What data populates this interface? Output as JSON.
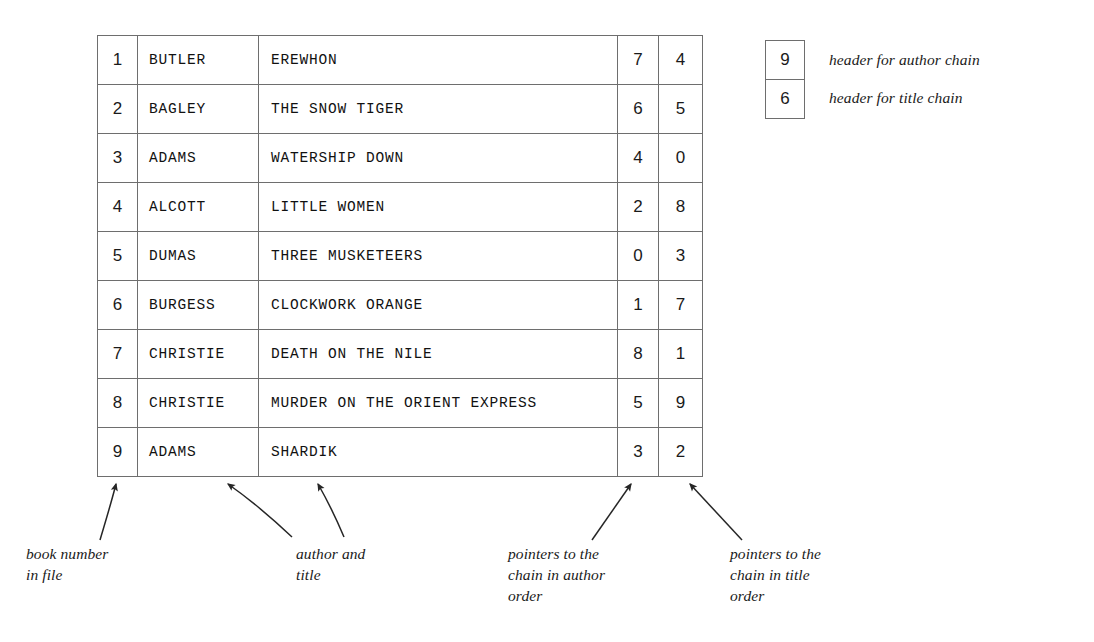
{
  "table": {
    "columns": [
      "book number",
      "author",
      "title",
      "author chain pointer",
      "title chain pointer"
    ],
    "rows": [
      {
        "num": "1",
        "author": "BUTLER",
        "title": "EREWHON",
        "ptr_author": "7",
        "ptr_title": "4"
      },
      {
        "num": "2",
        "author": "BAGLEY",
        "title": "THE SNOW TIGER",
        "ptr_author": "6",
        "ptr_title": "5"
      },
      {
        "num": "3",
        "author": "ADAMS",
        "title": "WATERSHIP DOWN",
        "ptr_author": "4",
        "ptr_title": "0"
      },
      {
        "num": "4",
        "author": "ALCOTT",
        "title": "LITTLE WOMEN",
        "ptr_author": "2",
        "ptr_title": "8"
      },
      {
        "num": "5",
        "author": "DUMAS",
        "title": "THREE MUSKETEERS",
        "ptr_author": "0",
        "ptr_title": "3"
      },
      {
        "num": "6",
        "author": "BURGESS",
        "title": "CLOCKWORK ORANGE",
        "ptr_author": "1",
        "ptr_title": "7"
      },
      {
        "num": "7",
        "author": "CHRISTIE",
        "title": "DEATH ON THE NILE",
        "ptr_author": "8",
        "ptr_title": "1"
      },
      {
        "num": "8",
        "author": "CHRISTIE",
        "title": "MURDER ON THE ORIENT EXPRESS",
        "ptr_author": "5",
        "ptr_title": "9"
      },
      {
        "num": "9",
        "author": "ADAMS",
        "title": "SHARDIK",
        "ptr_author": "3",
        "ptr_title": "2"
      }
    ]
  },
  "legend": {
    "author_chain_value": "9",
    "author_chain_label": "header for author chain",
    "title_chain_value": "6",
    "title_chain_label": "header for title chain"
  },
  "captions": {
    "book_number": "book number\nin file",
    "author_title": "author and\ntitle",
    "pointers_author": "pointers to the\nchain in author\norder",
    "pointers_title": "pointers to the\nchain in title\norder"
  },
  "colors": {
    "line": "#6e6e6e",
    "text": "#1a1a1a",
    "background": "#ffffff"
  }
}
